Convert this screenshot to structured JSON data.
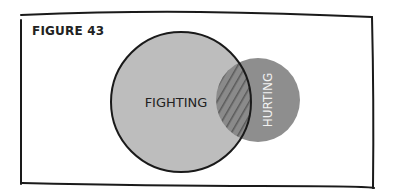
{
  "figure": {
    "title": "FIGURE 43"
  },
  "diagram": {
    "type": "venn",
    "sets": [
      {
        "label": "FIGHTING",
        "color": "#bdbdbd",
        "cx": 181,
        "cy": 102,
        "r": 70
      },
      {
        "label": "HURTING",
        "color": "#8e8e8e",
        "cx": 258,
        "cy": 100,
        "r": 42
      }
    ],
    "overlap": {
      "pattern": "hatched",
      "color": "#6e6e6e"
    }
  }
}
